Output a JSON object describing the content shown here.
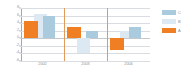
{
  "chart_data": {
    "type": "bar",
    "title": "",
    "xlabel": "",
    "ylabel": "",
    "categories": [
      "2002",
      "2003",
      "2004"
    ],
    "series": [
      {
        "name": "A",
        "color": "#f07f23",
        "values": [
          4.5,
          3,
          -3
        ]
      },
      {
        "name": "B",
        "color": "#dce9f2",
        "values": [
          6.5,
          -4,
          2
        ]
      },
      {
        "name": "C",
        "color": "#a9cbdd",
        "values": [
          6,
          2,
          3
        ]
      }
    ],
    "ylim": [
      -6,
      8
    ],
    "yticks": [
      "8",
      "6",
      "4",
      "2",
      "0",
      "-2",
      "-4",
      "-6"
    ],
    "grid": true,
    "legend_position": "right",
    "zero_line": "0"
  },
  "legend": {
    "items": [
      {
        "label": "C",
        "color": "#a9cbdd"
      },
      {
        "label": "B",
        "color": "#dce9f2"
      },
      {
        "label": "A",
        "color": "#f07f23"
      }
    ]
  },
  "colors": {
    "series_a": "#f07f23",
    "series_b": "#dce9f2",
    "series_c": "#a9cbdd",
    "gridline": "#d9dde1",
    "axis": "#e09a5a",
    "tick_text": "#8a8f94",
    "background": "#ffffff"
  }
}
